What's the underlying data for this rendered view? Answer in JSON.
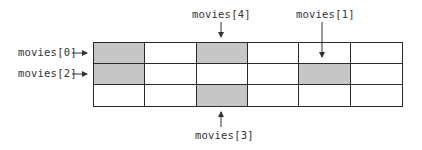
{
  "diagram": {
    "title": "",
    "grid": {
      "rows": 3,
      "cols": 6,
      "shaded_cells": [
        [
          0,
          0
        ],
        [
          1,
          0
        ],
        [
          0,
          2
        ],
        [
          1,
          4
        ],
        [
          2,
          2
        ]
      ],
      "shade_color": "#c6c6c6",
      "line_color": "#2a2a2a"
    },
    "labels": {
      "movies0": "movies[0]",
      "movies1": "movies[1]",
      "movies2": "movies[2]",
      "movies3": "movies[3]",
      "movies4": "movies[4]"
    }
  }
}
